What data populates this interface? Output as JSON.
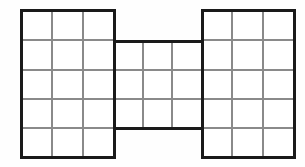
{
  "canvas": {
    "width": 305,
    "height": 167,
    "background_color": "#fefefe"
  },
  "figure": {
    "name": "h-shape-grid-figure",
    "outline_color": "#1a1a1a",
    "outline_width": 3,
    "gridline_color": "#8a8a8a",
    "gridline_width": 1.1,
    "fill_color": "#ffffff"
  },
  "blocks": [
    {
      "name": "left-block",
      "label": "left",
      "x0": 21,
      "y0": 10,
      "x1": 114,
      "y1": 157,
      "columns": 3,
      "rows": 5,
      "cells": 15
    },
    {
      "name": "middle-block",
      "label": "middle",
      "x0": 114,
      "y0": 41,
      "x1": 202,
      "y1": 128,
      "columns": 3,
      "rows": 3,
      "cells": 9
    },
    {
      "name": "right-block",
      "label": "right",
      "x0": 202,
      "y0": 10,
      "x1": 294,
      "y1": 157,
      "columns": 3,
      "rows": 5,
      "cells": 15
    }
  ],
  "geometry": {
    "left_column_lines": [
      52,
      83
    ],
    "right_column_lines": [
      232,
      263
    ],
    "middle_column_lines": [
      143,
      172
    ],
    "outer_row_lines": [
      40,
      70,
      99,
      128
    ],
    "middle_row_lines": [
      70,
      99
    ],
    "total_cells": 39
  }
}
